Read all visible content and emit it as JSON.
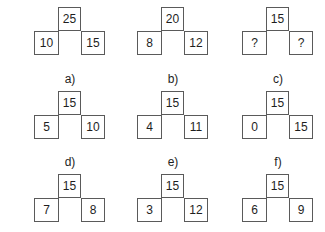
{
  "puzzles": [
    {
      "id": "example1",
      "label": "",
      "top": "25",
      "left": "10",
      "right": "15"
    },
    {
      "id": "example2",
      "label": "",
      "top": "20",
      "left": "8",
      "right": "12"
    },
    {
      "id": "question",
      "label": "",
      "top": "15",
      "left": "?",
      "right": "?"
    },
    {
      "id": "a",
      "label": "a)",
      "top": "15",
      "left": "5",
      "right": "10"
    },
    {
      "id": "b",
      "label": "b)",
      "top": "15",
      "left": "4",
      "right": "11"
    },
    {
      "id": "c",
      "label": "c)",
      "top": "15",
      "left": "0",
      "right": "15"
    },
    {
      "id": "d",
      "label": "d)",
      "top": "15",
      "left": "7",
      "right": "8"
    },
    {
      "id": "e",
      "label": "e)",
      "top": "15",
      "left": "3",
      "right": "12"
    },
    {
      "id": "f",
      "label": "f)",
      "top": "15",
      "left": "6",
      "right": "9"
    }
  ],
  "colors": {
    "border": "#5a5a5a",
    "text": "#1e1e1e",
    "background": "#ffffff"
  }
}
